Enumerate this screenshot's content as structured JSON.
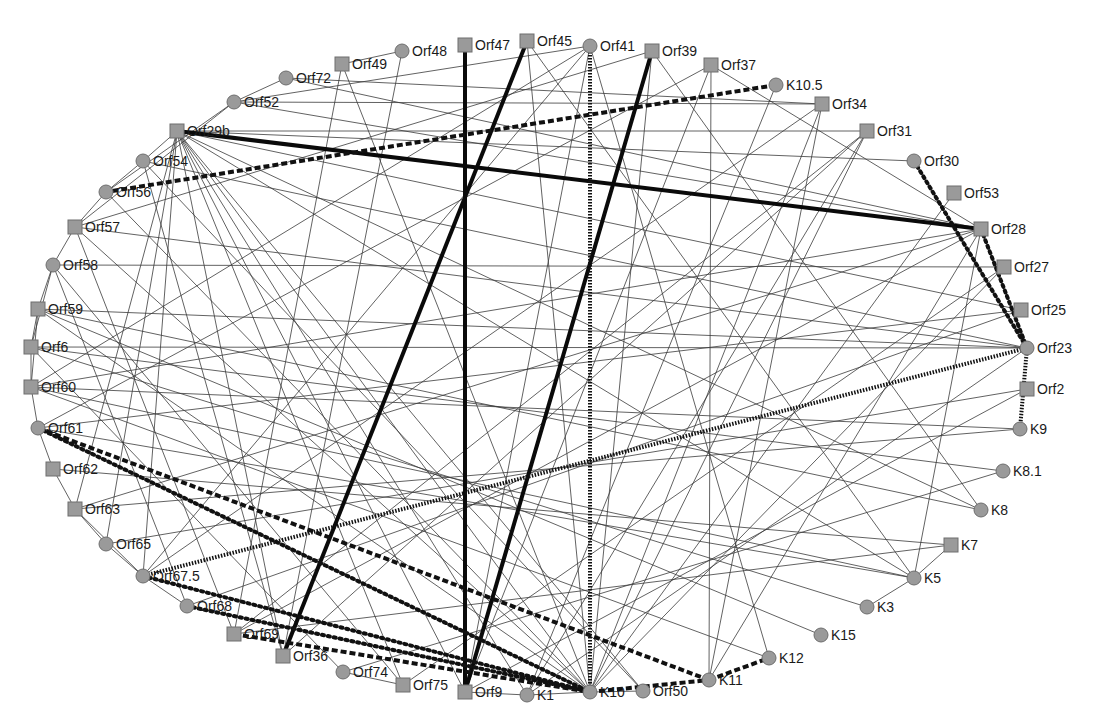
{
  "diagram": {
    "type": "protein-interaction-network",
    "node_fill": "#9a9a9a",
    "edge_color": "#3a3a3a",
    "nodes": [
      {
        "id": "Orf47",
        "label": "Orf47",
        "shape": "square",
        "x": 465,
        "y": 45
      },
      {
        "id": "Orf45",
        "label": "Orf45",
        "shape": "square",
        "x": 527,
        "y": 41
      },
      {
        "id": "Orf41",
        "label": "Orf41",
        "shape": "circle",
        "x": 590,
        "y": 46
      },
      {
        "id": "Orf39",
        "label": "Orf39",
        "shape": "square",
        "x": 652,
        "y": 51
      },
      {
        "id": "Orf37",
        "label": "Orf37",
        "shape": "square",
        "x": 711,
        "y": 65
      },
      {
        "id": "K10.5",
        "label": "K10.5",
        "shape": "circle",
        "x": 776,
        "y": 85
      },
      {
        "id": "Orf34",
        "label": "Orf34",
        "shape": "square",
        "x": 822,
        "y": 104
      },
      {
        "id": "Orf31",
        "label": "Orf31",
        "shape": "square",
        "x": 867,
        "y": 131
      },
      {
        "id": "Orf30",
        "label": "Orf30",
        "shape": "circle",
        "x": 914,
        "y": 161
      },
      {
        "id": "Orf53",
        "label": "Orf53",
        "shape": "square",
        "x": 954,
        "y": 193
      },
      {
        "id": "Orf28",
        "label": "Orf28",
        "shape": "square",
        "x": 981,
        "y": 229
      },
      {
        "id": "Orf27",
        "label": "Orf27",
        "shape": "square",
        "x": 1004,
        "y": 267
      },
      {
        "id": "Orf25",
        "label": "Orf25",
        "shape": "square",
        "x": 1021,
        "y": 310
      },
      {
        "id": "Orf23",
        "label": "Orf23",
        "shape": "circle",
        "x": 1027,
        "y": 348
      },
      {
        "id": "Orf2",
        "label": "Orf2",
        "shape": "square",
        "x": 1027,
        "y": 389
      },
      {
        "id": "K9",
        "label": "K9",
        "shape": "circle",
        "x": 1020,
        "y": 429
      },
      {
        "id": "K8.1",
        "label": "K8.1",
        "shape": "circle",
        "x": 1003,
        "y": 471
      },
      {
        "id": "K8",
        "label": "K8",
        "shape": "circle",
        "x": 981,
        "y": 510
      },
      {
        "id": "K7",
        "label": "K7",
        "shape": "square",
        "x": 951,
        "y": 545
      },
      {
        "id": "K5",
        "label": "K5",
        "shape": "circle",
        "x": 914,
        "y": 578
      },
      {
        "id": "K3",
        "label": "K3",
        "shape": "circle",
        "x": 867,
        "y": 607
      },
      {
        "id": "K15",
        "label": "K15",
        "shape": "circle",
        "x": 821,
        "y": 635
      },
      {
        "id": "K12",
        "label": "K12",
        "shape": "circle",
        "x": 769,
        "y": 658
      },
      {
        "id": "K11",
        "label": "K11",
        "shape": "circle",
        "x": 709,
        "y": 680
      },
      {
        "id": "Orf50",
        "label": "Orf50",
        "shape": "circle",
        "x": 643,
        "y": 691
      },
      {
        "id": "K10",
        "label": "K10",
        "shape": "circle",
        "x": 590,
        "y": 692
      },
      {
        "id": "K1",
        "label": "K1",
        "shape": "circle",
        "x": 527,
        "y": 695
      },
      {
        "id": "Orf9",
        "label": "Orf9",
        "shape": "square",
        "x": 465,
        "y": 692
      },
      {
        "id": "Orf75",
        "label": "Orf75",
        "shape": "square",
        "x": 403,
        "y": 685
      },
      {
        "id": "Orf74",
        "label": "Orf74",
        "shape": "circle",
        "x": 343,
        "y": 672
      },
      {
        "id": "Orf36",
        "label": "Orf36",
        "shape": "square",
        "x": 283,
        "y": 656
      },
      {
        "id": "Orf69",
        "label": "Orf69",
        "shape": "square",
        "x": 234,
        "y": 634
      },
      {
        "id": "Orf68",
        "label": "Orf68",
        "shape": "circle",
        "x": 187,
        "y": 606
      },
      {
        "id": "Orf67.5",
        "label": "Orf67.5",
        "shape": "circle",
        "x": 143,
        "y": 576
      },
      {
        "id": "Orf65",
        "label": "Orf65",
        "shape": "circle",
        "x": 106,
        "y": 544
      },
      {
        "id": "Orf63",
        "label": "Orf63",
        "shape": "square",
        "x": 75,
        "y": 509
      },
      {
        "id": "Orf62",
        "label": "Orf62",
        "shape": "square",
        "x": 53,
        "y": 469
      },
      {
        "id": "Orf61",
        "label": "Orf61",
        "shape": "circle",
        "x": 38,
        "y": 428
      },
      {
        "id": "Orf60",
        "label": "Orf60",
        "shape": "square",
        "x": 31,
        "y": 387
      },
      {
        "id": "Orf6",
        "label": "Orf6",
        "shape": "square",
        "x": 31,
        "y": 347
      },
      {
        "id": "Orf59",
        "label": "Orf59",
        "shape": "square",
        "x": 38,
        "y": 309
      },
      {
        "id": "Orf58",
        "label": "Orf58",
        "shape": "circle",
        "x": 53,
        "y": 265
      },
      {
        "id": "Orf57",
        "label": "Orf57",
        "shape": "square",
        "x": 75,
        "y": 227
      },
      {
        "id": "Orf56",
        "label": "Orf56",
        "shape": "circle",
        "x": 106,
        "y": 192
      },
      {
        "id": "Orf54",
        "label": "Orf54",
        "shape": "circle",
        "x": 143,
        "y": 161
      },
      {
        "id": "Orf29b",
        "label": "Orf29b",
        "shape": "square",
        "x": 177,
        "y": 131
      },
      {
        "id": "Orf52",
        "label": "Orf52",
        "shape": "circle",
        "x": 234,
        "y": 102
      },
      {
        "id": "Orf72",
        "label": "Orf72",
        "shape": "circle",
        "x": 286,
        "y": 78
      },
      {
        "id": "Orf49",
        "label": "Orf49",
        "shape": "square",
        "x": 342,
        "y": 64
      },
      {
        "id": "Orf48",
        "label": "Orf48",
        "shape": "circle",
        "x": 402,
        "y": 51
      }
    ],
    "strong_edges": [
      {
        "from": "Orf47",
        "to": "Orf9",
        "style": "thick"
      },
      {
        "from": "Orf45",
        "to": "Orf36",
        "style": "thick"
      },
      {
        "from": "Orf39",
        "to": "Orf9",
        "style": "thick"
      },
      {
        "from": "Orf29b",
        "to": "Orf28",
        "style": "thick"
      },
      {
        "from": "Orf41",
        "to": "K10",
        "style": "hatched"
      },
      {
        "from": "K10.5",
        "to": "Orf56",
        "style": "dashed"
      },
      {
        "from": "Orf23",
        "to": "Orf67.5",
        "style": "hatched"
      },
      {
        "from": "Orf30",
        "to": "Orf23",
        "style": "dotted"
      },
      {
        "from": "Orf28",
        "to": "Orf23",
        "style": "dotted"
      },
      {
        "from": "Orf23",
        "to": "K9",
        "style": "hatched"
      },
      {
        "from": "Orf61",
        "to": "K11",
        "style": "dashed"
      },
      {
        "from": "Orf61",
        "to": "K10",
        "style": "dotted"
      },
      {
        "from": "K11",
        "to": "K12",
        "style": "dashed"
      },
      {
        "from": "K10",
        "to": "K11",
        "style": "dashed"
      },
      {
        "from": "Orf67.5",
        "to": "K10",
        "style": "dotted"
      },
      {
        "from": "Orf68",
        "to": "K10",
        "style": "dotted"
      },
      {
        "from": "Orf69",
        "to": "K10",
        "style": "dashed"
      }
    ],
    "thin_edges": [
      [
        "Orf29b",
        "Orf31"
      ],
      [
        "Orf29b",
        "Orf30"
      ],
      [
        "Orf29b",
        "Orf25"
      ],
      [
        "Orf29b",
        "K8"
      ],
      [
        "Orf29b",
        "K5"
      ],
      [
        "Orf29b",
        "K10"
      ],
      [
        "Orf29b",
        "Orf50"
      ],
      [
        "Orf29b",
        "K1"
      ],
      [
        "Orf29b",
        "Orf9"
      ],
      [
        "Orf29b",
        "Orf75"
      ],
      [
        "Orf29b",
        "Orf36"
      ],
      [
        "Orf29b",
        "Orf63"
      ],
      [
        "Orf29b",
        "Orf65"
      ],
      [
        "Orf29b",
        "Orf67.5"
      ],
      [
        "Orf52",
        "Orf41"
      ],
      [
        "Orf52",
        "Orf28"
      ],
      [
        "Orf52",
        "Orf34"
      ],
      [
        "Orf52",
        "Orf72"
      ],
      [
        "Orf52",
        "Orf56"
      ],
      [
        "Orf52",
        "Orf57"
      ],
      [
        "Orf72",
        "Orf28"
      ],
      [
        "Orf72",
        "Orf34"
      ],
      [
        "Orf49",
        "Orf69"
      ],
      [
        "Orf49",
        "K10"
      ],
      [
        "Orf48",
        "Orf36"
      ],
      [
        "Orf48",
        "Orf49"
      ],
      [
        "Orf45",
        "K10"
      ],
      [
        "Orf45",
        "K5"
      ],
      [
        "Orf41",
        "Orf60"
      ],
      [
        "Orf41",
        "Orf67.5"
      ],
      [
        "Orf41",
        "Orf9"
      ],
      [
        "Orf41",
        "K12"
      ],
      [
        "Orf39",
        "K10"
      ],
      [
        "Orf39",
        "K8"
      ],
      [
        "Orf39",
        "Orf57"
      ],
      [
        "Orf37",
        "Orf28"
      ],
      [
        "Orf37",
        "Orf9"
      ],
      [
        "Orf37",
        "K11"
      ],
      [
        "Orf37",
        "Orf61"
      ],
      [
        "K10.5",
        "K1"
      ],
      [
        "Orf34",
        "K10"
      ],
      [
        "Orf34",
        "K11"
      ],
      [
        "Orf34",
        "Orf67.5"
      ],
      [
        "Orf31",
        "Orf36"
      ],
      [
        "Orf31",
        "K1"
      ],
      [
        "Orf31",
        "K10"
      ],
      [
        "Orf31",
        "Orf69"
      ],
      [
        "Orf53",
        "K10"
      ],
      [
        "Orf28",
        "Orf60"
      ],
      [
        "Orf28",
        "Orf63"
      ],
      [
        "Orf28",
        "K11"
      ],
      [
        "Orf28",
        "K5"
      ],
      [
        "Orf28",
        "Orf69"
      ],
      [
        "Orf27",
        "Orf58"
      ],
      [
        "Orf27",
        "K10"
      ],
      [
        "Orf27",
        "Orf75"
      ],
      [
        "Orf25",
        "Orf61"
      ],
      [
        "Orf25",
        "Orf68"
      ],
      [
        "Orf23",
        "Orf57"
      ],
      [
        "Orf23",
        "Orf59"
      ],
      [
        "Orf23",
        "Orf6"
      ],
      [
        "Orf23",
        "Orf54"
      ],
      [
        "Orf23",
        "K1"
      ],
      [
        "Orf2",
        "Orf65"
      ],
      [
        "Orf2",
        "Orf9"
      ],
      [
        "K9",
        "Orf60"
      ],
      [
        "K9",
        "Orf63"
      ],
      [
        "K8.1",
        "Orf6"
      ],
      [
        "K8.1",
        "Orf74"
      ],
      [
        "K8",
        "Orf59"
      ],
      [
        "K7",
        "Orf69"
      ],
      [
        "K7",
        "K5"
      ],
      [
        "K7",
        "Orf62"
      ],
      [
        "K5",
        "Orf60"
      ],
      [
        "K5",
        "Orf61"
      ],
      [
        "K5",
        "K3"
      ],
      [
        "K3",
        "Orf6"
      ],
      [
        "K15",
        "Orf59"
      ],
      [
        "K12",
        "Orf60"
      ],
      [
        "Orf50",
        "Orf54"
      ],
      [
        "Orf50",
        "K10"
      ],
      [
        "K10",
        "Orf56"
      ],
      [
        "K10",
        "Orf57"
      ],
      [
        "K10",
        "Orf59"
      ],
      [
        "K10",
        "K1"
      ],
      [
        "K1",
        "Orf9"
      ],
      [
        "Orf75",
        "Orf74"
      ],
      [
        "Orf75",
        "Orf58"
      ],
      [
        "Orf74",
        "Orf6"
      ],
      [
        "Orf36",
        "Orf54"
      ],
      [
        "Orf69",
        "Orf57"
      ],
      [
        "Orf68",
        "Orf58"
      ],
      [
        "Orf68",
        "Orf67.5"
      ],
      [
        "Orf67.5",
        "Orf65"
      ],
      [
        "Orf67.5",
        "Orf63"
      ],
      [
        "Orf63",
        "Orf62"
      ],
      [
        "Orf65",
        "Orf63"
      ],
      [
        "Orf62",
        "Orf61"
      ],
      [
        "Orf61",
        "Orf60"
      ],
      [
        "Orf60",
        "Orf6"
      ],
      [
        "Orf60",
        "Orf59"
      ],
      [
        "Orf6",
        "Orf59"
      ],
      [
        "Orf6",
        "Orf58"
      ],
      [
        "Orf59",
        "Orf58"
      ],
      [
        "Orf58",
        "Orf57"
      ],
      [
        "Orf57",
        "Orf56"
      ],
      [
        "Orf56",
        "Orf54"
      ],
      [
        "Orf54",
        "Orf29b"
      ]
    ]
  }
}
